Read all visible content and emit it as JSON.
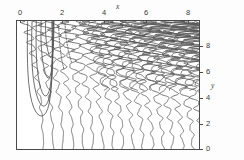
{
  "figure": {
    "background_color": "#fdfdfd",
    "line_color": "#555555",
    "frame_color": "#4a4a4a"
  },
  "axes": {
    "top": {
      "title": "x",
      "tick_labels": [
        "0",
        "2",
        "4",
        "6",
        "8"
      ],
      "tick_values": [
        0,
        2,
        4,
        6,
        8
      ],
      "range": [
        -0.2,
        9.2
      ],
      "position": "top"
    },
    "right": {
      "title": "y",
      "tick_labels": [
        "8",
        "6",
        "4",
        "2",
        "0"
      ],
      "tick_values": [
        8,
        6,
        4,
        2,
        0
      ],
      "range": [
        -0.2,
        9.4
      ],
      "position": "right"
    }
  },
  "chart_data": {
    "type": "line",
    "title": "",
    "subtitle": "",
    "xlabel": "x",
    "ylabel": "y",
    "xlim": [
      -0.2,
      9.2
    ],
    "ylim": [
      -0.2,
      9.4
    ],
    "xticks": [
      0,
      2,
      4,
      6,
      8
    ],
    "yticks": [
      0,
      2,
      4,
      6,
      8
    ],
    "grid": false,
    "legend": false,
    "legend_position": "none",
    "contour_levels": [
      -0.8,
      -0.6,
      -0.4,
      -0.2,
      0.0,
      0.2,
      0.4,
      0.6,
      0.8
    ],
    "series": [
      {
        "name": "nested-u-loop-outer",
        "style": "solid",
        "points_x": [
          0.35,
          0.33,
          0.34,
          0.4,
          0.55,
          0.78,
          1.05,
          1.3,
          1.48,
          1.58,
          1.62,
          1.62,
          1.6
        ],
        "points_y": [
          9.4,
          7.8,
          6.2,
          4.6,
          3.3,
          2.5,
          2.2,
          2.45,
          3.2,
          4.5,
          6.1,
          7.8,
          9.4
        ]
      },
      {
        "name": "nested-u-loop-inner",
        "style": "solid",
        "points_x": [
          0.8,
          0.78,
          0.8,
          0.88,
          1.02,
          1.2,
          1.38,
          1.52,
          1.6,
          1.64,
          1.66
        ],
        "points_y": [
          9.4,
          8.0,
          6.6,
          5.3,
          4.3,
          3.75,
          3.8,
          4.4,
          5.6,
          7.2,
          9.4
        ]
      },
      {
        "name": "dashed-contour-segment",
        "style": "dashed",
        "points_x": [
          1.95,
          1.98,
          2.04,
          2.12,
          2.22
        ],
        "points_y": [
          9.0,
          8.1,
          7.2,
          6.4,
          5.8
        ]
      },
      {
        "name": "slanted-zigzag-family",
        "style": "solid",
        "count": 26,
        "note": "Near-vertical wavy lines in the lower half that tilt increasingly to the left and gain amplitude/frequency with height, merging into dense diagonal striping above y = 6."
      }
    ]
  }
}
